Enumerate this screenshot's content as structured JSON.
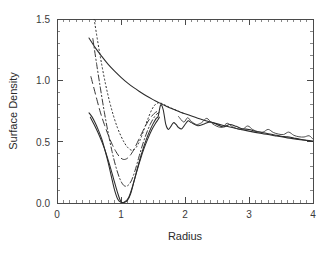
{
  "chart_data": {
    "type": "line",
    "title": "",
    "xlabel": "Radius",
    "ylabel": "Surface Density",
    "xlim": [
      0,
      4
    ],
    "ylim": [
      0.0,
      1.5
    ],
    "xticks": [
      0,
      1,
      2,
      3,
      4
    ],
    "xticklabels": [
      "0",
      "1",
      "2",
      "3",
      "4"
    ],
    "yticks": [
      0.0,
      0.5,
      1.0,
      1.5
    ],
    "yticklabels": [
      "0.0",
      "0.5",
      "1.0",
      "1.5"
    ],
    "x_minor_tick_interval": 0.1,
    "y_minor_tick_interval": 0.1,
    "grid": false,
    "legend": "none",
    "frame": "box",
    "series": [
      {
        "name": "unperturbed-profile",
        "style": "solid",
        "description": "Smooth monotonically declining background surface density profile",
        "x": [
          0.5,
          0.6,
          0.7,
          0.8,
          0.9,
          1.0,
          1.1,
          1.2,
          1.3,
          1.4,
          1.5,
          1.6,
          1.7,
          1.8,
          1.9,
          2.0,
          2.2,
          2.4,
          2.6,
          2.8,
          3.0,
          3.2,
          3.4,
          3.6,
          3.8,
          4.0
        ],
        "y": [
          1.345,
          1.265,
          1.195,
          1.13,
          1.075,
          1.025,
          0.98,
          0.94,
          0.905,
          0.872,
          0.843,
          0.816,
          0.791,
          0.768,
          0.747,
          0.727,
          0.691,
          0.66,
          0.632,
          0.608,
          0.586,
          0.566,
          0.548,
          0.531,
          0.516,
          0.502
        ]
      },
      {
        "name": "gap-profile-deepest",
        "style": "solid",
        "description": "Deep gap carved near radius 1, reaching zero surface density at the gap floor with oscillatory wake beyond radius 1.6",
        "x": [
          0.5,
          0.55,
          0.6,
          0.65,
          0.7,
          0.75,
          0.8,
          0.85,
          0.9,
          0.95,
          1.0,
          1.05,
          1.1,
          1.15,
          1.2,
          1.25,
          1.3,
          1.35,
          1.4,
          1.45,
          1.5,
          1.55,
          1.58,
          1.62,
          1.66,
          1.7,
          1.74,
          1.78,
          1.82,
          1.86,
          1.9,
          1.95,
          2.0,
          2.05,
          2.1,
          2.2,
          2.3,
          2.4,
          2.5,
          2.6,
          2.7,
          2.8,
          2.9,
          3.0,
          3.1,
          3.2,
          3.3,
          3.4,
          3.5,
          3.6,
          3.7,
          3.8,
          3.9,
          4.0
        ],
        "y": [
          0.735,
          0.7,
          0.65,
          0.59,
          0.52,
          0.43,
          0.33,
          0.215,
          0.105,
          0.03,
          0.005,
          0.005,
          0.02,
          0.075,
          0.17,
          0.27,
          0.365,
          0.45,
          0.525,
          0.59,
          0.645,
          0.69,
          0.705,
          0.8,
          0.76,
          0.64,
          0.6,
          0.625,
          0.655,
          0.64,
          0.615,
          0.605,
          0.64,
          0.67,
          0.655,
          0.63,
          0.645,
          0.66,
          0.64,
          0.62,
          0.64,
          0.625,
          0.605,
          0.6,
          0.585,
          0.575,
          0.565,
          0.555,
          0.545,
          0.54,
          0.53,
          0.52,
          0.512,
          0.505
        ]
      },
      {
        "name": "gap-profile-second",
        "style": "solid",
        "description": "Second nearly coincident deep gap profile tracing the same zero floor",
        "x": [
          0.52,
          0.58,
          0.64,
          0.7,
          0.76,
          0.82,
          0.88,
          0.94,
          1.0,
          1.06,
          1.12,
          1.18,
          1.24,
          1.3,
          1.36,
          1.42,
          1.48,
          1.54,
          1.58,
          1.6
        ],
        "y": [
          0.7,
          0.64,
          0.575,
          0.5,
          0.415,
          0.315,
          0.205,
          0.095,
          0.01,
          0.01,
          0.045,
          0.135,
          0.245,
          0.35,
          0.445,
          0.525,
          0.595,
          0.65,
          0.68,
          0.7
        ]
      },
      {
        "name": "gap-profile-long-dashed",
        "style": "long-dashed",
        "description": "Intermediate gap depth, long dashed, minimum near 0.30 at radius 1.0",
        "x": [
          0.53,
          0.58,
          0.63,
          0.68,
          0.74,
          0.8,
          0.86,
          0.92,
          0.98,
          1.04,
          1.1,
          1.16,
          1.22,
          1.28,
          1.34,
          1.4,
          1.46,
          1.52,
          1.56,
          1.6
        ],
        "y": [
          1.03,
          0.93,
          0.83,
          0.735,
          0.64,
          0.555,
          0.48,
          0.42,
          0.375,
          0.355,
          0.365,
          0.4,
          0.455,
          0.52,
          0.585,
          0.645,
          0.695,
          0.73,
          0.745,
          0.75
        ]
      },
      {
        "name": "gap-profile-dash-dot",
        "style": "dash-dot",
        "description": "Shallower gap, dash-dot, minimum near 0.14 at radius 1.05",
        "x": [
          0.56,
          0.62,
          0.68,
          0.74,
          0.8,
          0.86,
          0.92,
          0.98,
          1.04,
          1.1,
          1.16,
          1.22,
          1.28,
          1.34,
          1.4,
          1.46,
          1.52,
          1.56,
          1.6
        ],
        "y": [
          1.34,
          1.13,
          0.93,
          0.74,
          0.57,
          0.42,
          0.295,
          0.2,
          0.145,
          0.14,
          0.18,
          0.265,
          0.375,
          0.48,
          0.57,
          0.645,
          0.7,
          0.725,
          0.74
        ]
      },
      {
        "name": "gap-profile-dotted",
        "style": "dotted",
        "description": "Early-time shallow gap, dotted, minimum near 0.43 at radius 1.1",
        "x": [
          0.58,
          0.64,
          0.7,
          0.76,
          0.82,
          0.88,
          0.94,
          1.0,
          1.06,
          1.12,
          1.18,
          1.24,
          1.3,
          1.36,
          1.42,
          1.48,
          1.54,
          1.6,
          1.66,
          1.72,
          1.8,
          1.9,
          2.0
        ],
        "y": [
          1.5,
          1.305,
          1.125,
          0.965,
          0.83,
          0.715,
          0.62,
          0.545,
          0.485,
          0.445,
          0.43,
          0.455,
          0.515,
          0.6,
          0.685,
          0.76,
          0.805,
          0.818,
          0.805,
          0.79,
          0.77,
          0.748,
          0.727
        ]
      },
      {
        "name": "outer-wake-oscillation",
        "style": "solid-thin",
        "description": "Oscillatory spiral wake bumps superimposed on the outer disc profile between radius 1.9 and 4.0",
        "x": [
          1.9,
          1.98,
          2.04,
          2.1,
          2.18,
          2.26,
          2.34,
          2.42,
          2.5,
          2.58,
          2.66,
          2.74,
          2.82,
          2.9,
          2.98,
          3.06,
          3.14,
          3.22,
          3.3,
          3.38,
          3.46,
          3.54,
          3.62,
          3.7,
          3.78,
          3.86,
          3.94,
          4.0
        ],
        "y": [
          0.705,
          0.66,
          0.695,
          0.665,
          0.64,
          0.655,
          0.69,
          0.65,
          0.625,
          0.618,
          0.65,
          0.622,
          0.605,
          0.6,
          0.628,
          0.598,
          0.582,
          0.578,
          0.6,
          0.575,
          0.562,
          0.558,
          0.578,
          0.552,
          0.54,
          0.538,
          0.548,
          0.52
        ]
      }
    ]
  },
  "axes": {
    "xlabel": "Radius",
    "ylabel": "Surface Density",
    "xticklabels": [
      "0",
      "1",
      "2",
      "3",
      "4"
    ],
    "yticklabels": [
      "0.0",
      "0.5",
      "1.0",
      "1.5"
    ]
  },
  "colors": {
    "background": "#ffffff",
    "axis": "#4a4a4a",
    "curve": "#2b2b2b",
    "text": "#2a2a2a"
  }
}
